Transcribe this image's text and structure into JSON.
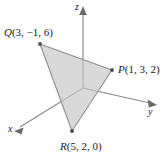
{
  "figure": {
    "background_color": "#ffffff",
    "axis_color": "#8c8c8c",
    "edge_color": "#8f8f8f",
    "fill_color": "#d4d4d4",
    "vertex_dot_color": "#4d4d4d",
    "text_color": "#1a1a1a"
  },
  "axes": [
    {
      "name": "x",
      "label": "x",
      "direction": "down-left",
      "arrow": true
    },
    {
      "name": "y",
      "label": "y",
      "direction": "right",
      "arrow": true
    },
    {
      "name": "z",
      "label": "z",
      "direction": "up",
      "arrow": true
    }
  ],
  "points": [
    {
      "name": "P",
      "label": "P",
      "coords_text": "(1, 3, 2)",
      "coords": [
        1,
        3,
        2
      ],
      "pixel": [
        112,
        70
      ]
    },
    {
      "name": "Q",
      "label": "Q",
      "coords_text": "(3, −1, 6)",
      "coords": [
        3,
        -1,
        6
      ],
      "pixel": [
        40,
        44
      ]
    },
    {
      "name": "R",
      "label": "R",
      "coords_text": "(5, 2, 0)",
      "coords": [
        5,
        2,
        0
      ],
      "pixel": [
        72,
        131
      ]
    }
  ],
  "triangle": {
    "name": "triangle-PQR",
    "vertices": [
      "P",
      "Q",
      "R"
    ]
  }
}
